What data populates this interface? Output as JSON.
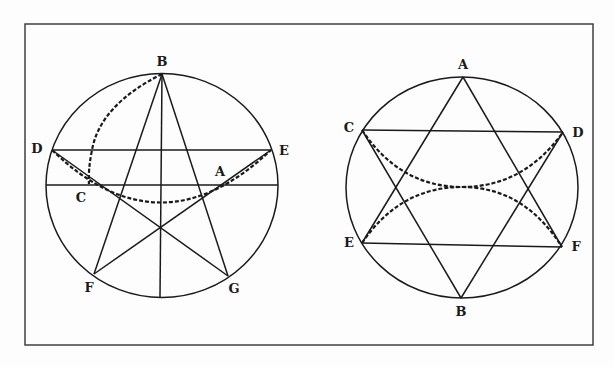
{
  "figure": {
    "frame": {
      "x": 25,
      "y": 24,
      "w": 568,
      "h": 321
    },
    "left_diagram": {
      "name": "pentagram-construction",
      "circle": {
        "cx": 162,
        "cy": 185.5,
        "rx": 116,
        "ry": 112
      },
      "points": {
        "B": {
          "x": 162,
          "y": 74,
          "label": "B",
          "lx": 162,
          "ly": 62
        },
        "D": {
          "x": 52,
          "y": 150,
          "label": "D",
          "lx": 37,
          "ly": 149
        },
        "E": {
          "x": 271,
          "y": 150,
          "label": "E",
          "lx": 284,
          "ly": 151
        },
        "C": {
          "x": 89,
          "y": 184,
          "label": "C",
          "lx": 81,
          "ly": 198
        },
        "A": {
          "x": 219,
          "y": 183,
          "label": "A",
          "lx": 220,
          "ly": 172
        },
        "F": {
          "x": 94,
          "y": 274,
          "label": "F",
          "lx": 89,
          "ly": 288
        },
        "G": {
          "x": 228,
          "y": 276,
          "label": "G",
          "lx": 234,
          "ly": 289
        },
        "Bottom": {
          "x": 160,
          "y": 297
        }
      }
    },
    "right_diagram": {
      "name": "hexagram-construction",
      "circle": {
        "cx": 462,
        "cy": 187.5,
        "rx": 116,
        "ry": 110.5
      },
      "points": {
        "A": {
          "x": 463,
          "y": 77,
          "label": "A",
          "lx": 463,
          "ly": 65
        },
        "C": {
          "x": 362,
          "y": 130,
          "label": "C",
          "lx": 349,
          "ly": 128
        },
        "D": {
          "x": 563,
          "y": 132,
          "label": "D",
          "lx": 578,
          "ly": 133
        },
        "E": {
          "x": 362,
          "y": 243,
          "label": "E",
          "lx": 349,
          "ly": 243
        },
        "F": {
          "x": 562,
          "y": 247,
          "label": "F",
          "lx": 576,
          "ly": 247
        },
        "B": {
          "x": 461,
          "y": 298,
          "label": "B",
          "lx": 461,
          "ly": 312
        }
      }
    }
  }
}
